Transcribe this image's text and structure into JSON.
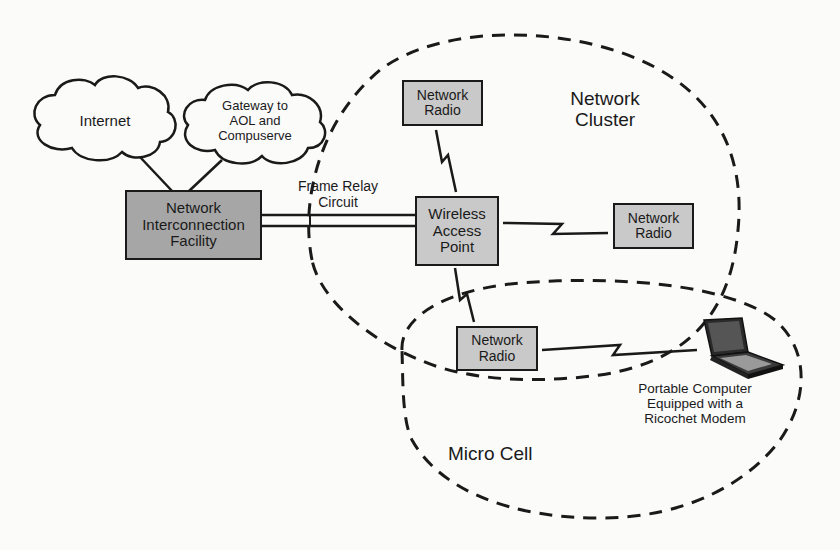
{
  "diagram": {
    "clouds": {
      "internet": {
        "label": "Internet"
      },
      "gateway": {
        "label": "Gateway to\nAOL and\nCompuserve"
      }
    },
    "boxes": {
      "nif": {
        "label": "Network\nInterconnection\nFacility"
      },
      "wap": {
        "label": "Wireless\nAccess\nPoint"
      },
      "radio_top": {
        "label": "Network\nRadio"
      },
      "radio_right": {
        "label": "Network\nRadio"
      },
      "radio_bottom": {
        "label": "Network\nRadio"
      }
    },
    "link_labels": {
      "frame_relay": "Frame Relay\nCircuit"
    },
    "regions": {
      "network_cluster": "Network\nCluster",
      "micro_cell": "Micro Cell"
    },
    "devices": {
      "laptop": {
        "label": "Portable Computer\nEquipped with a\nRicochet Modem"
      }
    },
    "colors": {
      "line": "#1a1a1a",
      "box_dark": "#a6a6a6",
      "box_light": "#c9c9c9",
      "background": "#fbfbfa"
    }
  }
}
